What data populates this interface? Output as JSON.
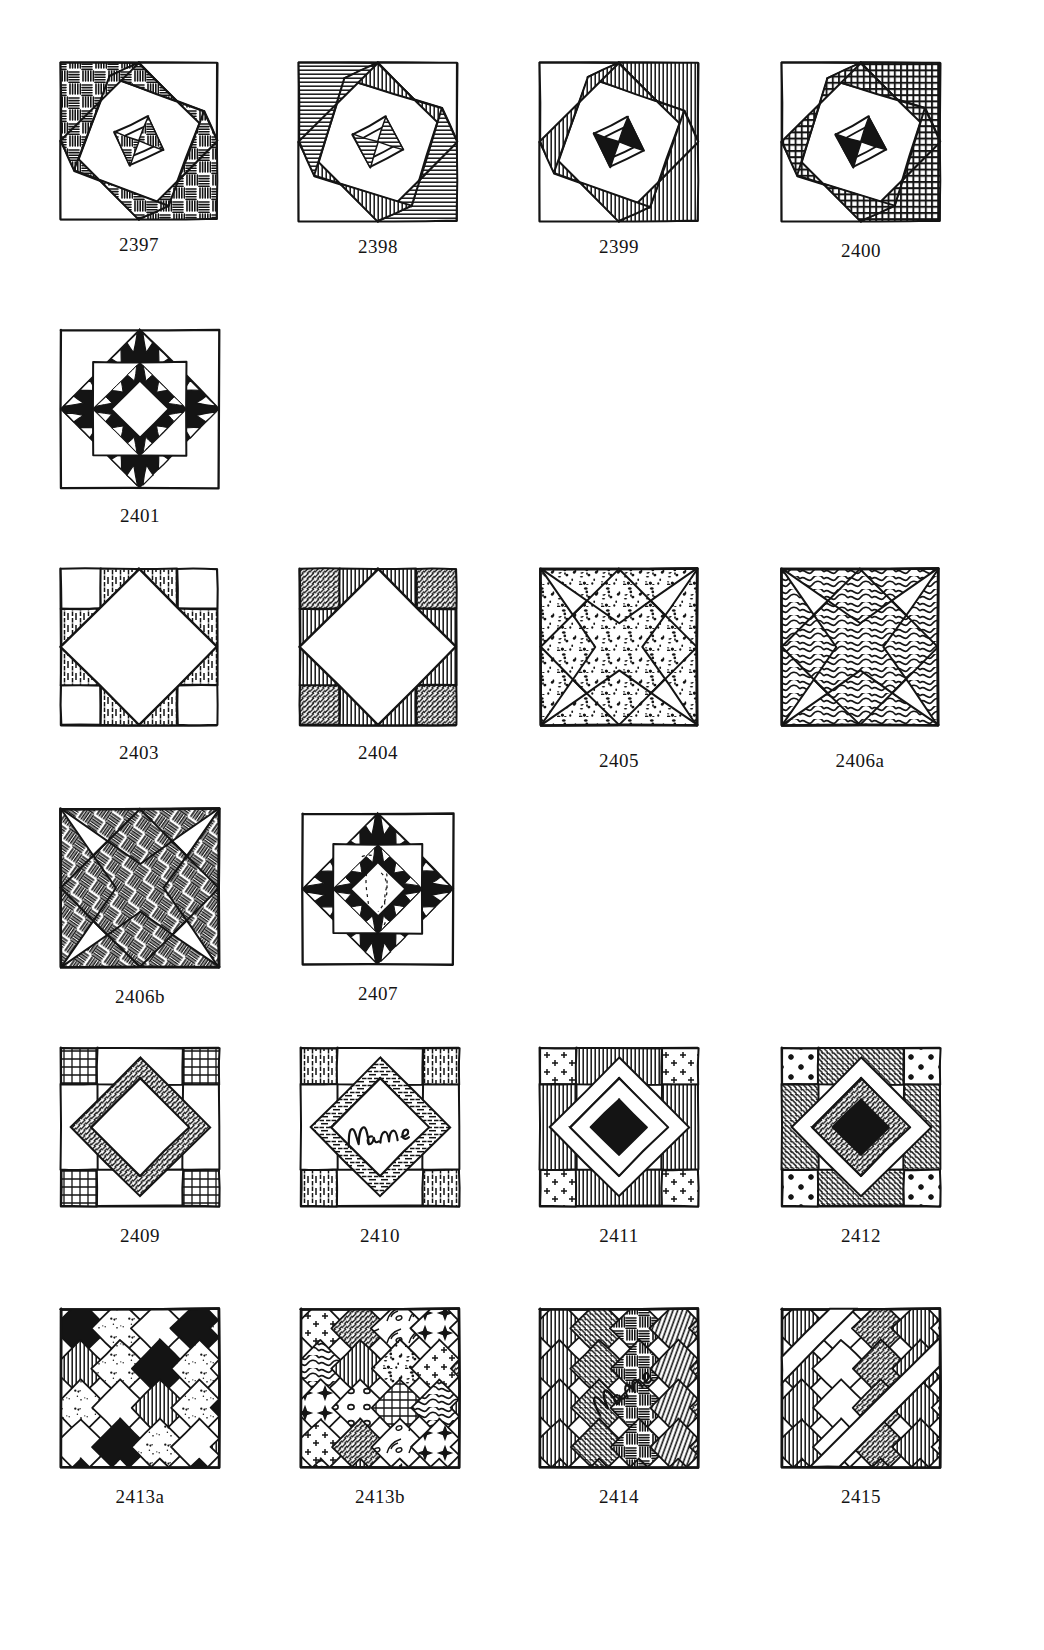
{
  "page": {
    "kind": "quilt-block-pattern-plate",
    "background_color": "#ffffff",
    "ink_color": "#141414",
    "width": 1044,
    "height": 1650
  },
  "blocks": [
    {
      "id": "b2397",
      "label": "2397",
      "x": 55,
      "y": 57,
      "size": 168,
      "caption_gap": 10,
      "design": "rotating-square-spiral",
      "fill": "basketweave-strokes",
      "description": "Square in a square rotated pinwheel with broken-dash texture fill"
    },
    {
      "id": "b2398",
      "label": "2398",
      "x": 293,
      "y": 57,
      "size": 170,
      "caption_gap": 10,
      "design": "rotating-square-spiral",
      "fill": "horizontal-line-hatch",
      "description": "Nested rotated squares with fine line hatching"
    },
    {
      "id": "b2399",
      "label": "2399",
      "x": 534,
      "y": 57,
      "size": 170,
      "caption_gap": 10,
      "design": "rotating-square-spiral",
      "fill": "vertical-line-hatch-solid",
      "description": "Nested rotated squares with vertical hatch plus solid black spiral"
    },
    {
      "id": "b2400",
      "label": "2400",
      "x": 776,
      "y": 57,
      "size": 170,
      "caption_gap": 14,
      "design": "rotating-square-spiral",
      "fill": "cross-grid-hatch",
      "description": "Nested rotated squares with dense cross-grid fill"
    },
    {
      "id": "b2401",
      "label": "2401",
      "x": 55,
      "y": 324,
      "size": 170,
      "caption_gap": 12,
      "design": "diamond-in-square-sawtooth",
      "fill": "solid-black-sawtooth",
      "description": "Solid black diamond frame with sawtooth triangles and open center diamond"
    },
    {
      "id": "b2403",
      "label": "2403",
      "x": 55,
      "y": 563,
      "size": 168,
      "caption_gap": 12,
      "design": "diamond-in-square-corners",
      "fill": "vertical-dash-hatch",
      "description": "Plain on-point diamond with hatched side triangles and plain corner squares"
    },
    {
      "id": "b2404",
      "label": "2404",
      "x": 294,
      "y": 563,
      "size": 168,
      "caption_gap": 12,
      "design": "diamond-in-square-pieced-corners",
      "fill": "stripe-and-dot-patches",
      "description": "Plain on-point diamond with pieced striped and dotted corner patches"
    },
    {
      "id": "b2405",
      "label": "2405",
      "x": 535,
      "y": 563,
      "size": 168,
      "caption_gap": 20,
      "design": "eight-point-star-on-point",
      "fill": "stipple-dots",
      "description": "Square-on-point with corner star points, stippled dot fill"
    },
    {
      "id": "b2406a",
      "label": "2406a",
      "x": 776,
      "y": 563,
      "size": 168,
      "caption_gap": 20,
      "design": "eight-point-star-on-point",
      "fill": "wavy-squiggle-lines",
      "description": "Square-on-point star with wavy squiggle line fill"
    },
    {
      "id": "b2406b",
      "label": "2406b",
      "x": 55,
      "y": 803,
      "size": 170,
      "caption_gap": 14,
      "design": "eight-point-star-on-point",
      "fill": "basketweave-strokes",
      "description": "Square-on-point star with woven brick texture fill"
    },
    {
      "id": "b2407",
      "label": "2407",
      "x": 297,
      "y": 808,
      "size": 162,
      "caption_gap": 14,
      "design": "diamond-with-sawtooth-border",
      "fill": "solid-black-triangles-sketch-center",
      "description": "On-point plain diamond with solid black sawtooth triangles and faint sketch inside"
    },
    {
      "id": "b2409",
      "label": "2409",
      "x": 55,
      "y": 1042,
      "size": 170,
      "caption_gap": 14,
      "design": "diamond-frame-with-corner-squares",
      "fill": "grid-check-and-diagonal-hatch",
      "description": "On-point open diamond framed by hatched bars, checked corner squares"
    },
    {
      "id": "b2410",
      "label": "2410",
      "x": 295,
      "y": 1042,
      "size": 170,
      "caption_gap": 14,
      "design": "diamond-frame-name-center",
      "fill": "dashed-bars-and-vertical-hatch",
      "handwriting": "Name",
      "description": "On-point open diamond with handwritten Name in the center"
    },
    {
      "id": "b2411",
      "label": "2411",
      "x": 534,
      "y": 1042,
      "size": 170,
      "caption_gap": 14,
      "design": "double-diamond-frame",
      "fill": "mixed-hatch-and-cross-print",
      "description": "Concentric on-point diamond frames with mixed prints"
    },
    {
      "id": "b2412",
      "label": "2412",
      "x": 776,
      "y": 1042,
      "size": 170,
      "caption_gap": 14,
      "design": "double-diamond-frame",
      "fill": "dark-diagonal-hatch-and-stars",
      "description": "Concentric on-point diamonds, dark diagonal hatch and star print"
    },
    {
      "id": "b2413a",
      "label": "2413a",
      "x": 55,
      "y": 1303,
      "size": 170,
      "caption_gap": 14,
      "design": "on-point-nine-patch-diamonds",
      "fill": "dotted-and-solid-alternating",
      "description": "Diagonal set diamond grid, alternating dotted and solid patches"
    },
    {
      "id": "b2413b",
      "label": "2413b",
      "x": 295,
      "y": 1303,
      "size": 170,
      "caption_gap": 14,
      "design": "on-point-nine-patch-diamonds",
      "fill": "sampler-prints",
      "description": "Diagonal set diamond grid, each patch a different sampler print"
    },
    {
      "id": "b2414",
      "label": "2414",
      "x": 534,
      "y": 1303,
      "size": 170,
      "caption_gap": 14,
      "design": "on-point-diamonds-with-name-bar",
      "fill": "diagonal-hatch-patches",
      "handwriting": "Name",
      "description": "Diagonal diamond set with open center bar holding handwritten Name"
    },
    {
      "id": "b2415",
      "label": "2415",
      "x": 776,
      "y": 1303,
      "size": 170,
      "caption_gap": 14,
      "design": "on-point-diamonds-with-sashing",
      "fill": "star-print-and-vertical-hatch",
      "description": "Diagonal diamond set with plain sashing crossing the block"
    }
  ]
}
